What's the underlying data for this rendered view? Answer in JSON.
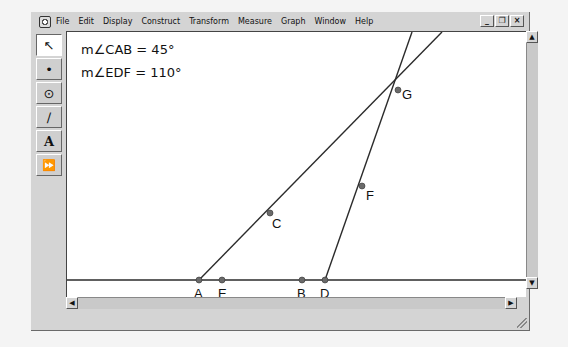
{
  "menubar": {
    "items": [
      "File",
      "Edit",
      "Display",
      "Construct",
      "Transform",
      "Measure",
      "Graph",
      "Window",
      "Help"
    ],
    "window_controls": [
      "_",
      "❐",
      "×"
    ]
  },
  "toolbox": {
    "tools": [
      {
        "name": "selection-arrow-tool",
        "glyph": "↖"
      },
      {
        "name": "point-tool",
        "glyph": "•"
      },
      {
        "name": "compass-tool",
        "glyph": "⊙"
      },
      {
        "name": "straightedge-tool",
        "glyph": "∕"
      },
      {
        "name": "text-tool",
        "glyph": "A"
      },
      {
        "name": "custom-tool",
        "glyph": "⏩"
      }
    ]
  },
  "measurements": [
    {
      "label": "m∠CAB = 45°"
    },
    {
      "label": "m∠EDF = 110°"
    }
  ],
  "geometry": {
    "points": {
      "A": [
        132,
        248
      ],
      "E": [
        155,
        248
      ],
      "B": [
        235,
        248
      ],
      "D": [
        258,
        248
      ],
      "C": [
        203,
        181
      ],
      "F": [
        295,
        154
      ],
      "G": [
        331,
        58
      ]
    },
    "labels": {
      "A": "A",
      "E": "E",
      "B": "B",
      "D": "D",
      "C": "C",
      "F": "F",
      "G": "G"
    },
    "line_color": "#2b2b2b",
    "point_color": "#6a6a6a"
  },
  "scrollbars": {
    "up": "▲",
    "down": "▼",
    "left": "◀",
    "right": "▶"
  }
}
